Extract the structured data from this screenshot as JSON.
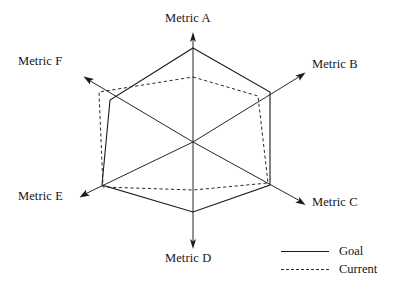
{
  "chart_data": {
    "type": "radar",
    "title": "",
    "subtitle": "",
    "xlabel": "",
    "ylabel": "",
    "grid": false,
    "legend_position": "bottom-right",
    "axis_max": 1.0,
    "categories": [
      "Metric A",
      "Metric B",
      "Metric C",
      "Metric D",
      "Metric E",
      "Metric F"
    ],
    "axis_angles_deg": [
      90,
      30,
      -30,
      -90,
      210,
      150
    ],
    "series": [
      {
        "name": "Goal",
        "style": "solid",
        "color": "#1a1a1a",
        "values": [
          1.0,
          0.95,
          0.95,
          0.75,
          0.95,
          0.63
        ],
        "points_px": [
          {
            "axis": "Metric A",
            "x": 193,
            "y": 48
          },
          {
            "axis": "Metric B",
            "x": 270,
            "y": 92
          },
          {
            "axis": "Metric C",
            "x": 270,
            "y": 185
          },
          {
            "axis": "Metric D",
            "x": 193,
            "y": 212
          },
          {
            "axis": "Metric E",
            "x": 102,
            "y": 185
          },
          {
            "axis": "Metric F",
            "x": 110,
            "y": 100
          }
        ]
      },
      {
        "name": "Current",
        "style": "dashed",
        "color": "#2b2b2b",
        "values": [
          0.69,
          0.81,
          0.92,
          0.51,
          0.97,
          0.75
        ],
        "points_px": [
          {
            "axis": "Metric A",
            "x": 193,
            "y": 77
          },
          {
            "axis": "Metric B",
            "x": 258,
            "y": 96
          },
          {
            "axis": "Metric C",
            "x": 268,
            "y": 183
          },
          {
            "axis": "Metric D",
            "x": 193,
            "y": 190
          },
          {
            "axis": "Metric E",
            "x": 103,
            "y": 187
          },
          {
            "axis": "Metric F",
            "x": 99,
            "y": 92
          }
        ]
      }
    ]
  },
  "axis_labels": [
    {
      "text": "Metric A",
      "left": 165,
      "top": 12
    },
    {
      "text": "Metric B",
      "left": 312,
      "top": 58
    },
    {
      "text": "Metric C",
      "left": 312,
      "top": 196
    },
    {
      "text": "Metric D",
      "left": 165,
      "top": 252
    },
    {
      "text": "Metric E",
      "left": 18,
      "top": 190
    },
    {
      "text": "Metric F",
      "left": 18,
      "top": 55
    }
  ],
  "legend": {
    "entries": [
      {
        "label": "Goal",
        "style": "solid"
      },
      {
        "label": "Current",
        "style": "dashed"
      }
    ]
  },
  "colors": {
    "background": "#ffffff",
    "goal": "#1a1a1a",
    "current": "#2b2b2b",
    "axis": "#262626"
  }
}
